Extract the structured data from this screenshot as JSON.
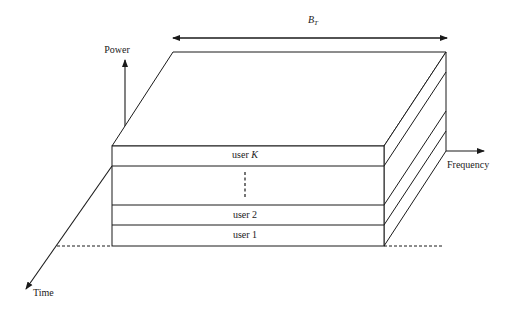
{
  "diagram": {
    "axes": {
      "power": {
        "label": "Power"
      },
      "frequency": {
        "label": "Frequency"
      },
      "time": {
        "label": "Time"
      }
    },
    "bandwidth": {
      "symbol": "B",
      "subscript": "T"
    },
    "layers": [
      {
        "label": "user K",
        "name_prefix": "user",
        "name_suffix": "K",
        "position": "top"
      },
      {
        "label": "⋮",
        "position": "ellipsis"
      },
      {
        "label": "user 2",
        "position": "second"
      },
      {
        "label": "user 1",
        "position": "bottom"
      }
    ],
    "colors": {
      "line": "#1a1a1a",
      "background": "#ffffff"
    }
  }
}
